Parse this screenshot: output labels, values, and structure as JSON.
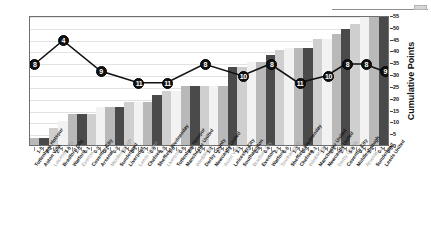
{
  "chart_data": {
    "type": "bar",
    "title": "",
    "subtitle": "",
    "xlabel": "",
    "ylabel": "Cumulative Points",
    "ylim": [
      0,
      55
    ],
    "yticks": [
      0,
      5,
      10,
      15,
      20,
      25,
      30,
      35,
      40,
      45,
      50,
      55
    ],
    "grid": true,
    "legend": "none",
    "categories": [
      "Tottenham Hotspur",
      "Aston Villa",
      "Leicester City",
      "Bradford City",
      "Watford",
      "Everton",
      "Coventry City",
      "Arsenal",
      "Middlesbrough",
      "Sunderland",
      "Liverpool",
      "Leeds United",
      "Chelsea",
      "Sheffield Wednesday",
      "Liverpool",
      "Tottenham Hotspur",
      "Manchester United",
      "Wimbledon",
      "Derby County",
      "Newcastle United",
      "Aston Villa",
      "Leicester City",
      "Southampton",
      "Bradford City",
      "Everton",
      "Watford",
      "Southampton",
      "Sheffield Wednesday",
      "Chelsea",
      "Wimbledon",
      "Manchester United",
      "Newcastle United",
      "Derby County",
      "Coventry City",
      "Middlesbrough",
      "Arsenal",
      "Sunderland",
      "Leeds United"
    ],
    "scores": [
      "1-0",
      "2-2",
      "2-1",
      "3-0",
      "1-0",
      "0-1",
      "0-3",
      "0-1",
      "0-2",
      "1-1",
      "0-1",
      "0-1",
      "0-0",
      "4-3",
      "1-0",
      "0-0",
      "2-4",
      "2-2",
      "1-1",
      "2-2",
      "1-1",
      "3-1",
      "1-3",
      "0-4",
      "0-4",
      "2-1",
      "0-0",
      "1-3",
      "0-0",
      "2-1",
      "1-2",
      "2-1",
      "2-1",
      "5-0",
      "0-1",
      "1-2",
      "0-1",
      "0-0"
    ],
    "bar_series_name": "Cumulative Points",
    "values": [
      3,
      3,
      7,
      10,
      13,
      13,
      13,
      16,
      16,
      16,
      18,
      18,
      18,
      21,
      23,
      23,
      25,
      25,
      25,
      25,
      25,
      33,
      33,
      35,
      35,
      38,
      40,
      41,
      41,
      41,
      45,
      45,
      47,
      49,
      51,
      54,
      54,
      54
    ],
    "line_series_name": "League Position",
    "line_values": [
      8,
      4,
      9,
      11,
      11,
      8,
      10,
      8,
      11,
      10,
      8,
      8,
      9
    ],
    "line_marker_labels": [
      "8",
      "4",
      "9",
      "11",
      "11",
      "8",
      "10",
      "8",
      "11",
      "10",
      "8",
      "8",
      "9"
    ],
    "line_marker_x_index": [
      0,
      3,
      7,
      11,
      14,
      18,
      22,
      25,
      28,
      31,
      33,
      35,
      37
    ],
    "bar_colors": [
      "#b9b9b9",
      "#4a4a4a",
      "#cfcfcf",
      "#f2f2f2"
    ],
    "line_color": "#111111",
    "marker_fill": "#111111",
    "marker_text_color": "#ffffff"
  },
  "yaxis": {
    "ticks": [
      "55",
      "50",
      "45",
      "40",
      "35",
      "30",
      "25",
      "20",
      "15",
      "10",
      "5",
      "0"
    ],
    "title": "Cumulative Points"
  }
}
